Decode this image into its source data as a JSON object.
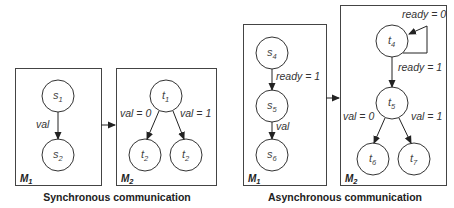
{
  "sync": {
    "caption": "Synchronous communication",
    "m1": {
      "label": "M",
      "label_sub": "1",
      "nodes": [
        {
          "name": "s",
          "sub": "1"
        },
        {
          "name": "s",
          "sub": "2"
        }
      ],
      "edges": [
        {
          "from": "s1",
          "to": "s2",
          "label": "val"
        }
      ]
    },
    "m2": {
      "label": "M",
      "label_sub": "2",
      "nodes": [
        {
          "name": "t",
          "sub": "1"
        },
        {
          "name": "t",
          "sub": "2"
        },
        {
          "name": "t",
          "sub": "2"
        }
      ],
      "edges": [
        {
          "from": "t1",
          "to": "t2",
          "label": "val = 0"
        },
        {
          "from": "t1",
          "to": "t2",
          "label": "val = 1"
        }
      ]
    }
  },
  "async": {
    "caption": "Asynchronous communication",
    "m1": {
      "label": "M",
      "label_sub": "1",
      "nodes": [
        {
          "name": "s",
          "sub": "4"
        },
        {
          "name": "s",
          "sub": "5"
        },
        {
          "name": "s",
          "sub": "6"
        }
      ],
      "edges": [
        {
          "from": "s4",
          "to": "s5",
          "label": "ready = 1"
        },
        {
          "from": "s5",
          "to": "s6",
          "label": "val"
        }
      ]
    },
    "m2": {
      "label": "M",
      "label_sub": "2",
      "nodes": [
        {
          "name": "t",
          "sub": "4"
        },
        {
          "name": "t",
          "sub": "5"
        },
        {
          "name": "t",
          "sub": "6"
        },
        {
          "name": "t",
          "sub": "7"
        }
      ],
      "edges": [
        {
          "from": "t4",
          "to": "t4",
          "label": "ready = 0"
        },
        {
          "from": "t4",
          "to": "t5",
          "label": "ready = 1"
        },
        {
          "from": "t5",
          "to": "t6",
          "label": "val = 0"
        },
        {
          "from": "t5",
          "to": "t7",
          "label": "val = 1"
        }
      ]
    }
  }
}
